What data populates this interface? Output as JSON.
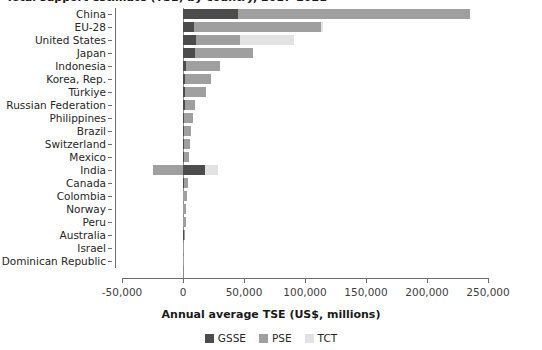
{
  "chart": {
    "title": "Total support estimate (TSE) by country, 2017-2021",
    "xlabel": "Annual average TSE (US$, millions)"
  },
  "legend": {
    "position": "bottom",
    "items": [
      {
        "name": "GSSE",
        "color": "#4c4c4c"
      },
      {
        "name": "PSE",
        "color": "#9f9f9f"
      },
      {
        "name": "TCT",
        "color": "#e2e2e2"
      }
    ]
  },
  "axis": {
    "ticks": [
      "-50,000",
      "0",
      "50,000",
      "100,000",
      "150,000",
      "200,000",
      "250,000"
    ],
    "tick_values": [
      -50000,
      0,
      50000,
      100000,
      150000,
      200000,
      250000
    ],
    "xlim": [
      -50000,
      250000
    ]
  },
  "chart_data": {
    "type": "bar",
    "orientation": "horizontal",
    "stacked": true,
    "title": "Total support estimate (TSE) by country, 2017-2021",
    "xlabel": "Annual average TSE (US$, millions)",
    "ylabel": "",
    "xlim": [
      -50000,
      250000
    ],
    "grid": false,
    "legend_position": "bottom",
    "categories": [
      "China",
      "EU-28",
      "United States",
      "Japan",
      "Indonesia",
      "Korea, Rep.",
      "Türkiye",
      "Russian Federation",
      "Philippines",
      "Brazil",
      "Switzerland",
      "Mexico",
      "India",
      "Canada",
      "Colombia",
      "Norway",
      "Peru",
      "Australia",
      "Israel",
      "Dominican Republic"
    ],
    "series": [
      {
        "name": "GSSE",
        "color": "#4c4c4c",
        "values": [
          45000,
          9000,
          11000,
          10000,
          2500,
          2000,
          1500,
          1500,
          800,
          700,
          600,
          600,
          18000,
          600,
          400,
          300,
          200,
          500,
          200,
          100
        ]
      },
      {
        "name": "PSE",
        "color": "#9f9f9f",
        "values": [
          190000,
          104000,
          36000,
          47000,
          28000,
          21000,
          17000,
          8000,
          7000,
          6000,
          5500,
          4500,
          -25000,
          3500,
          3000,
          2500,
          2000,
          1200,
          1000,
          500
        ]
      },
      {
        "name": "TCT",
        "color": "#e2e2e2",
        "values": [
          0,
          2000,
          44000,
          0,
          0,
          0,
          0,
          0,
          0,
          0,
          0,
          0,
          11000,
          0,
          0,
          0,
          0,
          0,
          0,
          0
        ]
      }
    ],
    "totals": [
      235000,
      115000,
      91000,
      57000,
      30500,
      23000,
      18500,
      9500,
      7800,
      6700,
      6100,
      5100,
      4000,
      4100,
      3400,
      2800,
      2200,
      1700,
      1200,
      600
    ]
  }
}
